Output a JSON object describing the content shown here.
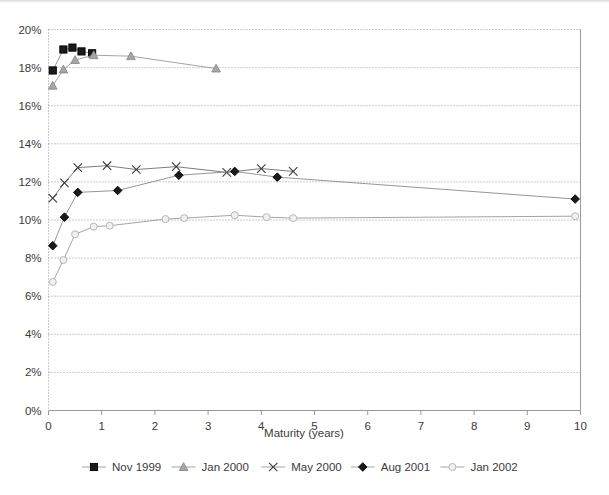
{
  "chart_data": {
    "type": "line",
    "title": "",
    "subtitle": "",
    "xlabel": "Maturity (years)",
    "ylabel": "",
    "xlim": [
      0,
      10
    ],
    "ylim": [
      0,
      20
    ],
    "xticks": [
      0,
      1,
      2,
      3,
      4,
      5,
      6,
      7,
      8,
      9,
      10
    ],
    "xtick_labels": [
      "0",
      "1",
      "2",
      "3",
      "4",
      "5",
      "6",
      "7",
      "8",
      "9",
      "10"
    ],
    "yticks": [
      0,
      2,
      4,
      6,
      8,
      10,
      12,
      14,
      16,
      18,
      20
    ],
    "ytick_labels": [
      "0%",
      "2%",
      "4%",
      "6%",
      "8%",
      "10%",
      "12%",
      "14%",
      "16%",
      "18%",
      "20%"
    ],
    "grid": "horizontal-dotted",
    "legend_position": "bottom",
    "series": [
      {
        "name": "Nov 1999",
        "marker": "filled-square",
        "color": "#1a1a1a",
        "line_color": "#8a8a8a",
        "x": [
          0.08,
          0.28,
          0.45,
          0.62,
          0.82
        ],
        "y": [
          17.85,
          18.95,
          19.05,
          18.85,
          18.75
        ]
      },
      {
        "name": "Jan 2000",
        "marker": "filled-triangle",
        "color": "#a6a6a6",
        "line_color": "#9a9a9a",
        "x": [
          0.08,
          0.28,
          0.5,
          0.85,
          1.55,
          3.15
        ],
        "y": [
          17.05,
          17.9,
          18.4,
          18.65,
          18.6,
          17.95
        ]
      },
      {
        "name": "May 2000",
        "marker": "cross",
        "color": "#3a3a3a",
        "line_color": "#6e6e6e",
        "x": [
          0.08,
          0.3,
          0.55,
          1.1,
          1.65,
          2.4,
          3.35,
          4.0,
          4.6
        ],
        "y": [
          11.15,
          11.95,
          12.75,
          12.85,
          12.65,
          12.8,
          12.5,
          12.7,
          12.55
        ]
      },
      {
        "name": "Aug 2001",
        "marker": "filled-diamond",
        "color": "#1a1a1a",
        "line_color": "#8a8a8a",
        "x": [
          0.08,
          0.3,
          0.55,
          1.3,
          2.45,
          3.5,
          4.3,
          9.9
        ],
        "y": [
          8.65,
          10.15,
          11.45,
          11.55,
          12.35,
          12.55,
          12.25,
          11.1
        ]
      },
      {
        "name": "Jan 2002",
        "marker": "open-circle",
        "color": "#b0b0b0",
        "line_color": "#9a9a9a",
        "x": [
          0.08,
          0.28,
          0.5,
          0.85,
          1.15,
          2.2,
          2.55,
          3.5,
          4.1,
          4.6,
          9.9
        ],
        "y": [
          6.75,
          7.9,
          9.25,
          9.65,
          9.7,
          10.05,
          10.1,
          10.25,
          10.15,
          10.1,
          10.2
        ]
      }
    ],
    "legend_entries": [
      {
        "label": "Nov 1999",
        "marker": "filled-square"
      },
      {
        "label": "Jan 2000",
        "marker": "filled-triangle"
      },
      {
        "label": "May 2000",
        "marker": "cross"
      },
      {
        "label": "Aug 2001",
        "marker": "filled-diamond"
      },
      {
        "label": "Jan 2002",
        "marker": "open-circle"
      }
    ]
  }
}
